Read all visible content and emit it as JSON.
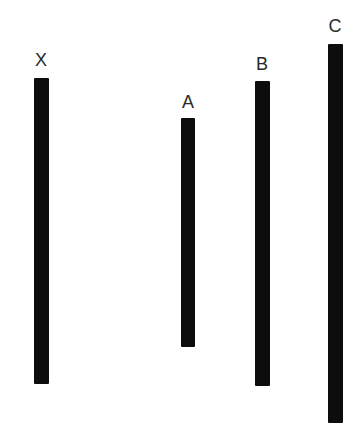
{
  "figure": {
    "type": "line-length-comparison",
    "background": "#ffffff",
    "bar_color": "#0d0d0d",
    "label_color": "#2a2a2a"
  },
  "lines": [
    {
      "id": "x",
      "label": "X",
      "left": 34,
      "top": 78,
      "width": 15,
      "height": 306,
      "label_left": 31,
      "label_top": 51
    },
    {
      "id": "a",
      "label": "A",
      "left": 181,
      "top": 118,
      "width": 14,
      "height": 229,
      "label_left": 178,
      "label_top": 93
    },
    {
      "id": "b",
      "label": "B",
      "left": 255,
      "top": 81,
      "width": 15,
      "height": 305,
      "label_left": 252,
      "label_top": 55
    },
    {
      "id": "c",
      "label": "C",
      "left": 328,
      "top": 44,
      "width": 15,
      "height": 379,
      "label_left": 325,
      "label_top": 17
    }
  ]
}
